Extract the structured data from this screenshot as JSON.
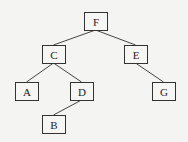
{
  "diagram": {
    "type": "binary-tree",
    "nodes": [
      {
        "id": "F",
        "label": "F",
        "x": 84,
        "y": 12
      },
      {
        "id": "C",
        "label": "C",
        "x": 42,
        "y": 45
      },
      {
        "id": "E",
        "label": "E",
        "x": 124,
        "y": 45
      },
      {
        "id": "A",
        "label": "A",
        "x": 15,
        "y": 82
      },
      {
        "id": "D",
        "label": "D",
        "x": 70,
        "y": 82
      },
      {
        "id": "G",
        "label": "G",
        "x": 152,
        "y": 82
      },
      {
        "id": "B",
        "label": "B",
        "x": 42,
        "y": 115
      }
    ],
    "edges": [
      {
        "from": "F",
        "to": "C"
      },
      {
        "from": "F",
        "to": "E"
      },
      {
        "from": "C",
        "to": "A"
      },
      {
        "from": "C",
        "to": "D"
      },
      {
        "from": "E",
        "to": "G"
      },
      {
        "from": "D",
        "to": "B"
      }
    ]
  }
}
